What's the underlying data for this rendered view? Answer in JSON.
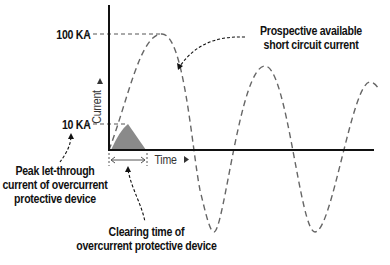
{
  "diagram": {
    "y_axis_label": "Current",
    "x_axis_label": "Time",
    "y_ticks": [
      "100 KA",
      "10 KA"
    ],
    "annotations": {
      "prospective": [
        "Prospective available",
        "short circuit current"
      ],
      "peak_let_through": [
        "Peak let-through",
        "current of overcurrent",
        "protective device"
      ],
      "clearing_time": [
        "Clearing time of",
        "overcurrent protective device"
      ]
    },
    "colors": {
      "axis": "#111111",
      "wave": "#666666",
      "let_through_fill": "#8a8a8a"
    }
  }
}
